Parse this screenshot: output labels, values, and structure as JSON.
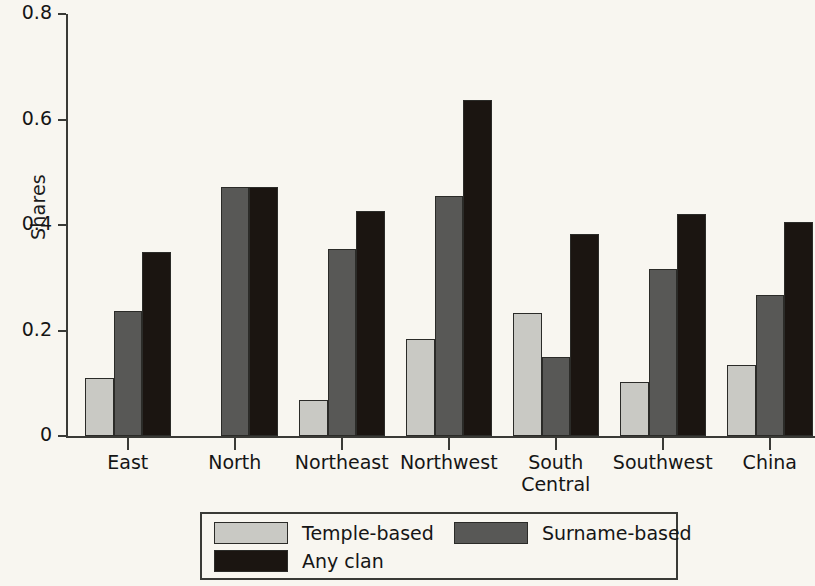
{
  "chart_data": {
    "type": "bar",
    "title": "",
    "subtitle": "",
    "xlabel": "",
    "ylabel": "Shares",
    "ylim": [
      0,
      0.8
    ],
    "yticks": [
      "0",
      "0.2",
      "0.4",
      "0.6",
      "0.8"
    ],
    "ytick_values": [
      0,
      0.2,
      0.4,
      0.6,
      0.8
    ],
    "grid": false,
    "legend_position": "bottom",
    "categories": [
      "East",
      "North",
      "Northeast",
      "Northwest",
      "South\nCentral",
      "Southwest",
      "China"
    ],
    "series": [
      {
        "name": "Temple-based",
        "color": "#c9c9c4",
        "values": [
          0.11,
          null,
          0.068,
          0.183,
          0.234,
          0.103,
          0.135
        ]
      },
      {
        "name": "Surname-based",
        "color": "#585856",
        "values": [
          0.237,
          0.472,
          0.354,
          0.455,
          0.15,
          0.316,
          0.268
        ]
      },
      {
        "name": "Any clan",
        "color": "#1b1511",
        "values": [
          0.348,
          0.472,
          0.427,
          0.637,
          0.383,
          0.421,
          0.405
        ]
      }
    ],
    "legend_entries": [
      "Temple-based",
      "Surname-based",
      "Any clan"
    ]
  },
  "axis": {
    "y_title": "Shares"
  }
}
